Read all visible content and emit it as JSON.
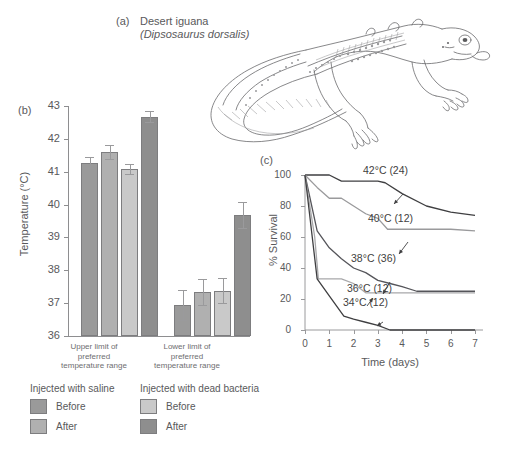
{
  "panel_a": {
    "tag": "(a)",
    "common_name": "Desert iguana",
    "species": "(Dipsosaurus dorsalis)",
    "illustration": "desert-iguana-line-drawing"
  },
  "panel_b": {
    "tag": "(b)",
    "ylabel": "Temperature (°C)",
    "yticks": [
      "43",
      "42",
      "41",
      "40",
      "39",
      "38",
      "37",
      "36"
    ],
    "group_labels": [
      "Upper limit of\npreferred\ntemperature range",
      "Lower limit of\npreferred\ntemperature range"
    ]
  },
  "legend": {
    "columns": [
      {
        "title": "Injected with saline",
        "entries": [
          {
            "label": "Before",
            "color": "#9a9a9a"
          },
          {
            "label": "After",
            "color": "#b0b0b0"
          }
        ]
      },
      {
        "title": "Injected with dead bacteria",
        "entries": [
          {
            "label": "Before",
            "color": "#c9c9c9"
          },
          {
            "label": "After",
            "color": "#8e8e8e"
          }
        ]
      }
    ]
  },
  "panel_c": {
    "tag": "(c)",
    "ylabel": "% Survival",
    "xlabel": "Time (days)",
    "yticks": [
      "100",
      "80",
      "60",
      "40",
      "20",
      "0"
    ],
    "xticks": [
      "0",
      "1",
      "2",
      "3",
      "4",
      "5",
      "6",
      "7"
    ],
    "annotations": [
      "42°C (24)",
      "40°C (12)",
      "38°C (36)",
      "36°C (12)",
      "34°C (12)"
    ]
  },
  "chart_data": [
    {
      "type": "bar",
      "panel": "(b)",
      "title": "",
      "xlabel": "",
      "ylabel": "Temperature (°C)",
      "ylim": [
        36,
        43
      ],
      "yticks": [
        36,
        37,
        38,
        39,
        40,
        41,
        42,
        43
      ],
      "grid": false,
      "categories": [
        "Upper limit of preferred temperature range",
        "Lower limit of preferred temperature range"
      ],
      "series": [
        {
          "name": "Injected with saline – Before",
          "color": "#9a9a9a",
          "values": [
            41.28,
            36.95
          ],
          "errors": [
            0.18,
            0.45
          ]
        },
        {
          "name": "Injected with saline – After",
          "color": "#b0b0b0",
          "values": [
            41.6,
            37.35
          ],
          "errors": [
            0.22,
            0.4
          ]
        },
        {
          "name": "Injected with dead bacteria – Before",
          "color": "#c9c9c9",
          "values": [
            41.08,
            37.38
          ],
          "errors": [
            0.15,
            0.38
          ]
        },
        {
          "name": "Injected with dead bacteria – After",
          "color": "#8e8e8e",
          "values": [
            42.68,
            39.68
          ],
          "errors": [
            0.17,
            0.4
          ]
        }
      ]
    },
    {
      "type": "line",
      "panel": "(c)",
      "title": "",
      "xlabel": "Time (days)",
      "ylabel": "% Survival",
      "xlim": [
        0,
        7
      ],
      "ylim": [
        0,
        100
      ],
      "xticks": [
        0,
        1,
        2,
        3,
        4,
        5,
        6,
        7
      ],
      "yticks": [
        0,
        20,
        40,
        60,
        80,
        100
      ],
      "grid": false,
      "legend_position": "inline-annotations",
      "series": [
        {
          "name": "42°C (24)",
          "n": 24,
          "color": "#3f3f41",
          "x": [
            0,
            0.5,
            1,
            1.5,
            2,
            2.5,
            3,
            3.3,
            4,
            5,
            6,
            7
          ],
          "y": [
            100,
            100,
            100,
            96,
            96,
            96,
            96,
            95,
            88,
            80,
            76,
            74
          ]
        },
        {
          "name": "40°C (12)",
          "n": 12,
          "color": "#9a9a9c",
          "x": [
            0,
            0.5,
            1,
            1.5,
            2,
            2.5,
            3,
            3.4,
            4,
            5,
            6,
            7
          ],
          "y": [
            100,
            92,
            85,
            85,
            80,
            75,
            72,
            65,
            65,
            65,
            65,
            64
          ]
        },
        {
          "name": "38°C (36)",
          "n": 36,
          "color": "#55555a",
          "x": [
            0,
            0.5,
            1,
            1.5,
            2,
            2.5,
            3,
            3.5,
            4,
            4.6,
            5,
            6,
            7
          ],
          "y": [
            100,
            64,
            53,
            46,
            40,
            37,
            32,
            30,
            28,
            25,
            25,
            25,
            25
          ]
        },
        {
          "name": "36°C (12)",
          "n": 12,
          "color": "#a8a8aa",
          "x": [
            0,
            0.4,
            0.55,
            1,
            1.5,
            2,
            2.5,
            3,
            4,
            5,
            6,
            7
          ],
          "y": [
            100,
            60,
            33,
            33,
            33,
            30,
            24,
            24,
            24,
            24,
            24,
            24
          ]
        },
        {
          "name": "34°C (12)",
          "n": 12,
          "color": "#3f3f41",
          "x": [
            0,
            0.5,
            1,
            1.6,
            2,
            2.5,
            3,
            3.5,
            4,
            5,
            6,
            7
          ],
          "y": [
            100,
            33,
            22,
            9,
            7,
            5,
            3,
            0,
            0,
            0,
            0,
            0
          ]
        }
      ]
    }
  ]
}
